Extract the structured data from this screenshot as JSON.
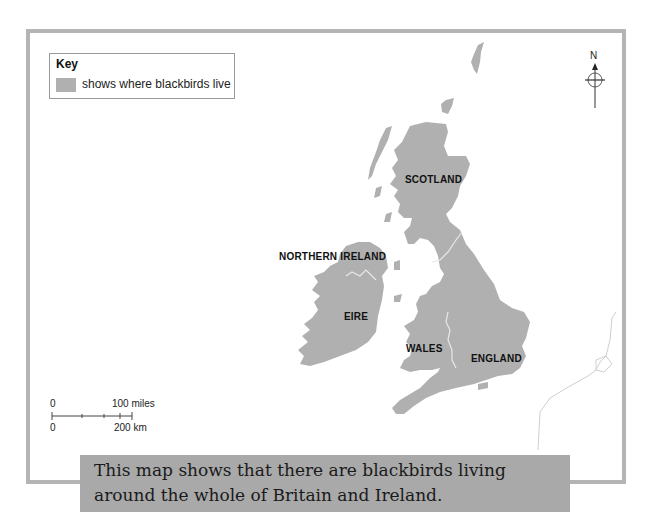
{
  "key": {
    "title": "Key",
    "swatch_color": "#b0b0b0",
    "label": "shows where blackbirds live"
  },
  "compass": {
    "north_label": "N"
  },
  "regions": [
    {
      "name": "SCOTLAND"
    },
    {
      "name": "NORTHERN IRELAND"
    },
    {
      "name": "EIRE"
    },
    {
      "name": "WALES"
    },
    {
      "name": "ENGLAND"
    }
  ],
  "scale": {
    "miles_start": "0",
    "miles_end": "100 miles",
    "km_start": "0",
    "km_end": "200 km"
  },
  "caption": {
    "text": "This map shows that there are blackbirds living around the whole of Britain and Ireland."
  },
  "colors": {
    "land": "#b0b0b0",
    "frame": "#b4b4b4",
    "caption_bg": "#a9a9a9",
    "border_line": "#e8e8e8"
  }
}
